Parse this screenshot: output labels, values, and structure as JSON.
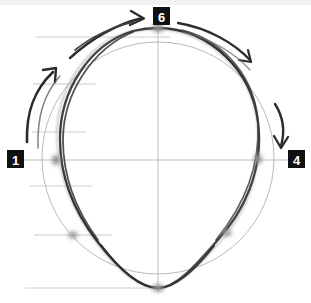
{
  "figure": {
    "canvas": {
      "width": 311,
      "height": 303,
      "background": "#ffffff"
    }
  },
  "colors": {
    "paper": "#ffffff",
    "badge_fill": "#111111",
    "badge_text": "#ffffff",
    "sketch_dark": "#3a3a3a",
    "sketch_mid": "#555555",
    "reference_circle": "#b9b9b9",
    "guide_line": "#c9c9c9",
    "crosshair": "#bdbdbd",
    "anchor_dot": "#9a9a9a",
    "arrow": "#2e2e2e",
    "scan_band": "#f2f2f2"
  },
  "badges": [
    {
      "id": "badge-top",
      "label": "6",
      "position": "top",
      "x": 153,
      "y": 7
    },
    {
      "id": "badge-left",
      "label": "1",
      "position": "left",
      "x": 7,
      "y": 150
    },
    {
      "id": "badge-right",
      "label": "4",
      "position": "right",
      "x": 288,
      "y": 150
    }
  ],
  "reference_circle": {
    "name": "light-reference-circle",
    "center_x": 158,
    "center_y": 158,
    "radius": 116,
    "stroke": "#b9b9b9",
    "stroke_width": 1
  },
  "crosshair": {
    "vertical": {
      "x": 158,
      "y1": 24,
      "y2": 290
    },
    "horizontal": {
      "y": 160,
      "x1": 24,
      "x2": 288
    },
    "stroke": "#bdbdbd"
  },
  "guide_lines": [
    {
      "label": "guide-1",
      "y": 37,
      "x1": 36,
      "x2": 170
    },
    {
      "label": "guide-2",
      "y": 84,
      "x1": 33,
      "x2": 96
    },
    {
      "label": "guide-3",
      "y": 132,
      "x1": 32,
      "x2": 86
    },
    {
      "label": "guide-4",
      "y": 160,
      "x1": 24,
      "x2": 288
    },
    {
      "label": "guide-5",
      "y": 186,
      "x1": 30,
      "x2": 92
    },
    {
      "label": "guide-6",
      "y": 235,
      "x1": 34,
      "x2": 112
    },
    {
      "label": "guide-7",
      "y": 288,
      "x1": 25,
      "x2": 160
    }
  ],
  "anchor_dots": [
    {
      "label": "dot-top",
      "x": 158,
      "y": 28
    },
    {
      "label": "dot-left",
      "x": 55,
      "y": 160
    },
    {
      "label": "dot-right",
      "x": 258,
      "y": 159
    },
    {
      "label": "dot-lower-left",
      "x": 72,
      "y": 235
    },
    {
      "label": "dot-lower-right",
      "x": 227,
      "y": 233
    },
    {
      "label": "dot-bottom",
      "x": 158,
      "y": 288
    }
  ],
  "arrows": [
    {
      "label": "arrow-upper-left-outer",
      "direction": "clockwise",
      "points_to": "top"
    },
    {
      "label": "arrow-upper-left-inner",
      "direction": "clockwise",
      "points_to": "upper-left"
    },
    {
      "label": "arrow-left-long",
      "direction": "clockwise",
      "points_to": "upper-left"
    },
    {
      "label": "arrow-upper-right",
      "direction": "clockwise",
      "points_to": "right"
    },
    {
      "label": "arrow-right-short",
      "direction": "clockwise",
      "points_to": "lower-right"
    }
  ]
}
